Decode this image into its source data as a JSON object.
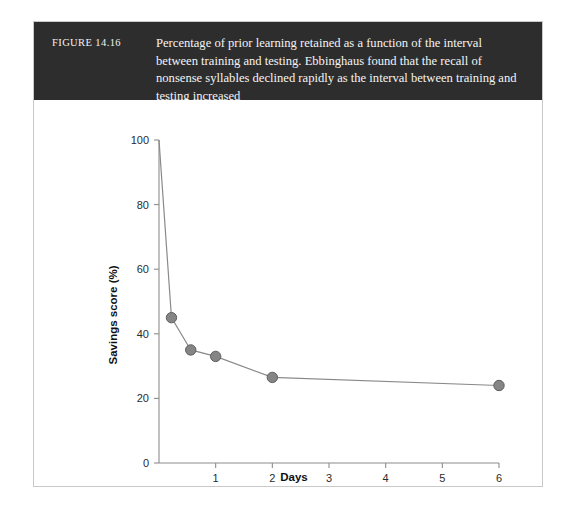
{
  "figure": {
    "number_label": "FIGURE 14.16",
    "caption": "Percentage of prior learning retained as a function of the interval between training and testing. Ebbinghaus found that the recall of nonsense syllables declined rapidly as the interval between training and testing increased"
  },
  "colors": {
    "banner_background": "#2d2d2d",
    "banner_text": "#f4f4f4",
    "card_background": "#ffffff",
    "card_border": "#c9c9c9",
    "line": "#8a8a8a",
    "marker_fill": "#858585",
    "marker_stroke": "#5e5e5e",
    "axis": "#8c8c8c",
    "tick_text": "#2b2b2b"
  },
  "chart_data": {
    "type": "line",
    "title": "",
    "xlabel": "Days",
    "ylabel": "Savings score (%)",
    "xlim": [
      0,
      6
    ],
    "ylim": [
      0,
      100
    ],
    "grid": false,
    "legend": "none",
    "xticks": [
      1,
      2,
      3,
      4,
      5,
      6
    ],
    "xtick_labels": [
      "1",
      "2",
      "3",
      "4",
      "5",
      "6"
    ],
    "yticks": [
      0,
      20,
      40,
      60,
      80,
      100
    ],
    "ytick_labels": [
      "0",
      "20",
      "40",
      "60",
      "80",
      "100"
    ],
    "series": [
      {
        "name": "Savings score",
        "marker": "circle",
        "points": [
          {
            "x": 0,
            "y": 100,
            "marker_visible": false
          },
          {
            "x": 0.22,
            "y": 45,
            "marker_visible": true
          },
          {
            "x": 0.56,
            "y": 35,
            "marker_visible": true
          },
          {
            "x": 1,
            "y": 33,
            "marker_visible": true
          },
          {
            "x": 2,
            "y": 26.5,
            "marker_visible": true
          },
          {
            "x": 6,
            "y": 24,
            "marker_visible": true
          }
        ]
      }
    ]
  }
}
